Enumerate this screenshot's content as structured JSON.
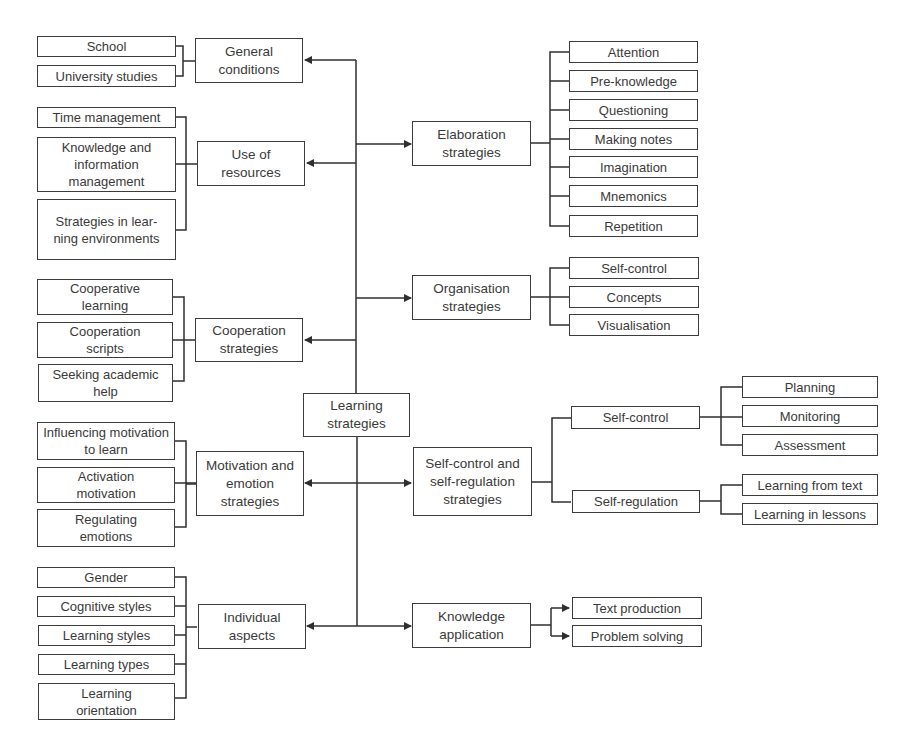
{
  "diagram": {
    "root": {
      "label": "Learning strategies"
    },
    "left": {
      "general_conditions": {
        "label": "General conditions",
        "children": [
          "School",
          "University studies"
        ]
      },
      "use_of_resources": {
        "label": "Use of resources",
        "children": [
          "Time management",
          "Knowledge and information management",
          "Strategies in lear-ning environments"
        ]
      },
      "cooperation": {
        "label": "Cooperation strategies",
        "children": [
          "Cooperative learning",
          "Cooperation scripts",
          "Seeking academic help"
        ]
      },
      "motivation": {
        "label": "Motivation and emotion strategies",
        "children": [
          "Influencing motivation to learn",
          "Activation motivation",
          "Regulating emotions"
        ]
      },
      "individual": {
        "label": "Individual aspects",
        "children": [
          "Gender",
          "Cognitive styles",
          "Learning styles",
          "Learning types",
          "Learning orientation"
        ]
      }
    },
    "right": {
      "elaboration": {
        "label": "Elaboration strategies",
        "children": [
          "Attention",
          "Pre-knowledge",
          "Questioning",
          "Making notes",
          "Imagination",
          "Mnemonics",
          "Repetition"
        ]
      },
      "organisation": {
        "label": "Organisation strategies",
        "children": [
          "Self-control",
          "Concepts",
          "Visualisation"
        ]
      },
      "self_control_regulation": {
        "label": "Self-control and self-regulation strategies",
        "groups": [
          {
            "label": "Self-control",
            "children": [
              "Planning",
              "Monitoring",
              "Assessment"
            ]
          },
          {
            "label": "Self-regulation",
            "children": [
              "Learning from text",
              "Learning in lessons"
            ]
          }
        ]
      },
      "knowledge_application": {
        "label": "Knowledge application",
        "children": [
          "Text production",
          "Problem solving"
        ]
      }
    },
    "colors": {
      "line": "#2f2f2f",
      "border": "#3c3c3c",
      "text": "#3a3a3a",
      "background": "#ffffff"
    }
  }
}
